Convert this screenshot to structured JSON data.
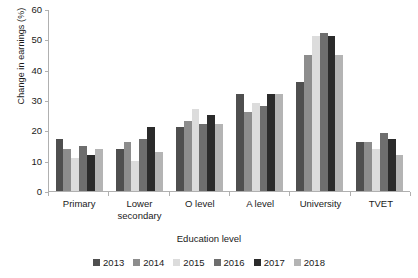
{
  "chart_data": {
    "type": "bar",
    "title": "",
    "xlabel": "Education level",
    "ylabel": "Change in earnings (%)",
    "categories": [
      "Primary",
      "Lower secondary",
      "O level",
      "A level",
      "University",
      "TVET"
    ],
    "series": [
      {
        "name": "2013",
        "color": "#4f4f4f",
        "values": [
          17,
          14,
          21,
          32,
          36,
          16
        ]
      },
      {
        "name": "2014",
        "color": "#8d8d8d",
        "values": [
          14,
          16,
          23,
          26,
          45,
          16
        ]
      },
      {
        "name": "2015",
        "color": "#dcdcdc",
        "values": [
          11,
          10,
          27,
          29,
          51,
          14
        ]
      },
      {
        "name": "2016",
        "color": "#6e6e6e",
        "values": [
          15,
          17,
          22,
          28,
          52,
          19
        ]
      },
      {
        "name": "2017",
        "color": "#2b2b2b",
        "values": [
          12,
          21,
          25,
          32,
          51,
          17
        ]
      },
      {
        "name": "2018",
        "color": "#b4b4b4",
        "values": [
          14,
          13,
          22,
          32,
          45,
          12
        ]
      }
    ],
    "ylim": [
      0,
      60
    ],
    "yticks": [
      0,
      10,
      20,
      30,
      40,
      50,
      60
    ],
    "grid": false,
    "legend_position": "bottom"
  }
}
